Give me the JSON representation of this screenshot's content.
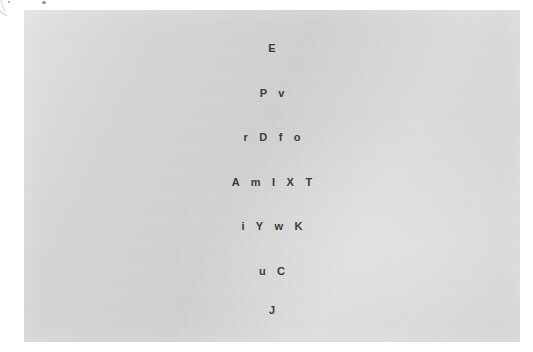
{
  "canvas": {
    "width": 533,
    "height": 352,
    "background_color": "#ffffff"
  },
  "panel": {
    "name": "gray-paper-panel",
    "fill_color": "#d4d4d4",
    "left": 24,
    "top": 10,
    "width": 496,
    "height": 332
  },
  "text_style": {
    "color": "#3a3a3a",
    "weight": "bold",
    "size_px": 11,
    "letter_spacing_px": 4.2
  },
  "letter_pyramid": {
    "alignment": "center",
    "row_count": 7,
    "rows": [
      {
        "index": 1,
        "text": "E",
        "letters": [
          "E"
        ],
        "count": 1
      },
      {
        "index": 2,
        "text": "P v",
        "letters": [
          "P",
          "v"
        ],
        "count": 2
      },
      {
        "index": 3,
        "text": "r D f o",
        "letters": [
          "r",
          "D",
          "f",
          "o"
        ],
        "count": 4
      },
      {
        "index": 4,
        "text": "A m I X T",
        "letters": [
          "A",
          "m",
          "I",
          "X",
          "T"
        ],
        "count": 5
      },
      {
        "index": 5,
        "text": "i Y w K",
        "letters": [
          "i",
          "Y",
          "w",
          "K"
        ],
        "count": 4
      },
      {
        "index": 6,
        "text": "u C",
        "letters": [
          "u",
          "C"
        ],
        "count": 2
      },
      {
        "index": 7,
        "text": "J",
        "letters": [
          "J"
        ],
        "count": 1
      }
    ],
    "all_letters": "E P v r D f o A m I X T i Y w K u C J",
    "shape": "diamond"
  },
  "artifacts": {
    "corner_mark": "diagonal-pencil-stroke-top-left",
    "top_speck": "small-dark-speck"
  }
}
